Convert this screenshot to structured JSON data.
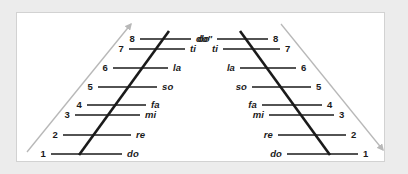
{
  "figure": {
    "colors": {
      "page_background": "#ececec",
      "panel_background": "#ffffff",
      "panel_border": "#d2d2d2",
      "rung_line": "#1a1a1a",
      "diagonal_line": "#1a1a1a",
      "arrow": "#b8b8b8",
      "text": "#1a1a1a"
    },
    "arrows": [
      {
        "name": "ascending-arrow",
        "direction": "up-right",
        "x1": 27,
        "y1": 152,
        "x2": 131,
        "y2": 24
      },
      {
        "name": "descending-arrow",
        "direction": "down-right",
        "x1": 281,
        "y1": 24,
        "x2": 383,
        "y2": 150
      }
    ],
    "left_ladder": {
      "name": "ascending-ladder",
      "number_side": "left",
      "syllable_side": "right",
      "diagonal": {
        "x1": 79,
        "y1": 155,
        "x2": 169,
        "y2": 31
      },
      "rungs": [
        {
          "degree": "1",
          "syllable": "do",
          "y": 154,
          "x_left": 51,
          "x_right": 122,
          "num_x": 46,
          "syl_x": 127
        },
        {
          "degree": "2",
          "syllable": "re",
          "y": 135,
          "x_left": 63,
          "x_right": 131,
          "num_x": 58,
          "syl_x": 136
        },
        {
          "degree": "3",
          "syllable": "mi",
          "y": 115,
          "x_left": 75,
          "x_right": 140,
          "num_x": 70,
          "syl_x": 145
        },
        {
          "degree": "4",
          "syllable": "fa",
          "y": 105,
          "x_left": 87,
          "x_right": 146,
          "num_x": 82,
          "syl_x": 151
        },
        {
          "degree": "5",
          "syllable": "so",
          "y": 87,
          "x_left": 98,
          "x_right": 157,
          "num_x": 93,
          "syl_x": 162
        },
        {
          "degree": "6",
          "syllable": "la",
          "y": 68,
          "x_left": 113,
          "x_right": 168,
          "num_x": 108,
          "syl_x": 173
        },
        {
          "degree": "7",
          "syllable": "ti",
          "y": 49,
          "x_left": 129,
          "x_right": 185,
          "num_x": 124,
          "syl_x": 190
        },
        {
          "degree": "8",
          "syllable": "do'",
          "y": 39,
          "x_left": 140,
          "x_right": 191,
          "num_x": 135,
          "syl_x": 196
        }
      ]
    },
    "right_ladder": {
      "name": "descending-ladder",
      "number_side": "right",
      "syllable_side": "left",
      "diagonal": {
        "x1": 240,
        "y1": 31,
        "x2": 330,
        "y2": 155
      },
      "rungs": [
        {
          "degree": "8",
          "syllable": "do'",
          "y": 39,
          "x_left": 217,
          "x_right": 268,
          "num_x": 273,
          "syl_x": 212
        },
        {
          "degree": "7",
          "syllable": "ti",
          "y": 49,
          "x_left": 223,
          "x_right": 280,
          "num_x": 285,
          "syl_x": 218
        },
        {
          "degree": "6",
          "syllable": "la",
          "y": 68,
          "x_left": 240,
          "x_right": 296,
          "num_x": 301,
          "syl_x": 235
        },
        {
          "degree": "5",
          "syllable": "so",
          "y": 87,
          "x_left": 252,
          "x_right": 311,
          "num_x": 316,
          "syl_x": 247
        },
        {
          "degree": "4",
          "syllable": "fa",
          "y": 105,
          "x_left": 262,
          "x_right": 322,
          "num_x": 327,
          "syl_x": 257
        },
        {
          "degree": "3",
          "syllable": "mi",
          "y": 115,
          "x_left": 269,
          "x_right": 334,
          "num_x": 339,
          "syl_x": 264
        },
        {
          "degree": "2",
          "syllable": "re",
          "y": 135,
          "x_left": 278,
          "x_right": 346,
          "num_x": 351,
          "syl_x": 273
        },
        {
          "degree": "1",
          "syllable": "do",
          "y": 154,
          "x_left": 287,
          "x_right": 358,
          "num_x": 363,
          "syl_x": 282
        }
      ]
    }
  },
  "chart_data": {
    "type": "diagram",
    "degrees": [
      "1",
      "2",
      "3",
      "4",
      "5",
      "6",
      "7",
      "8"
    ],
    "syllables": [
      "do",
      "re",
      "mi",
      "fa",
      "so",
      "la",
      "ti",
      "do'"
    ],
    "rung_y_positions": [
      154,
      135,
      115,
      105,
      87,
      68,
      49,
      39
    ],
    "intervals": [
      "whole",
      "whole",
      "half",
      "whole",
      "whole",
      "whole",
      "half"
    ],
    "legend": [
      "ascending (left)",
      "descending (right)"
    ]
  }
}
